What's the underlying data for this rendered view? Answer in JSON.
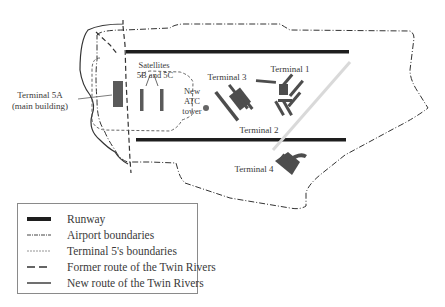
{
  "figure": {
    "type": "airport-layout-map",
    "labels": {
      "terminal_5a": [
        "Terminal 5A",
        "(main building)"
      ],
      "satellites": [
        "Satellites",
        "5B and 5C"
      ],
      "atc_tower": [
        "New",
        "ATC",
        "tower"
      ],
      "terminal_1": "Terminal 1",
      "terminal_2": "Terminal 2",
      "terminal_3": "Terminal 3",
      "terminal_4": "Terminal 4"
    },
    "colors": {
      "runway": "#1e1e1e",
      "building": "#555555",
      "boundary": "#333333",
      "terminal5_boundary": "#777777",
      "road": "#d9d9d9"
    }
  },
  "legend": {
    "items": [
      {
        "key": "runway",
        "label": "Runway"
      },
      {
        "key": "airport-boundaries",
        "label": "Airport boundaries"
      },
      {
        "key": "terminal5-boundaries",
        "label": "Terminal 5's boundaries"
      },
      {
        "key": "former-river-route",
        "label": "Former route of the Twin Rivers"
      },
      {
        "key": "new-river-route",
        "label": "New route of the Twin Rivers"
      }
    ]
  }
}
